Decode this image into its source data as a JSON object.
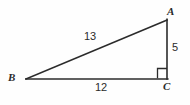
{
  "figure": {
    "type": "right-triangle-diagram",
    "background_color": "#fefefe",
    "stroke_color": "#2b2b2b",
    "text_color": "#2b2b2b",
    "vertices": {
      "A": {
        "label": "A",
        "x": 167,
        "y": 20
      },
      "B": {
        "label": "B",
        "x": 26,
        "y": 79
      },
      "C": {
        "label": "C",
        "x": 167,
        "y": 79
      }
    },
    "sides": {
      "hypotenuse": {
        "label": "13",
        "from": "B",
        "to": "A"
      },
      "base": {
        "label": "12",
        "from": "B",
        "to": "C"
      },
      "vertical": {
        "label": "5",
        "from": "A",
        "to": "C"
      }
    },
    "right_angle": {
      "at_vertex": "C",
      "marker": "right-angle-square",
      "size": 10
    }
  }
}
